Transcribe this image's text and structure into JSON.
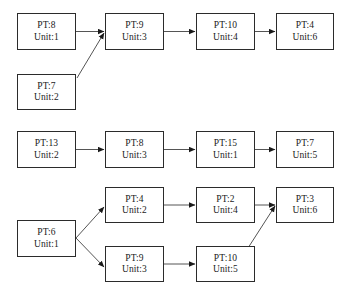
{
  "diagram": {
    "type": "process-flow",
    "background_color": "#ffffff",
    "node_fill_color": "#ffffff",
    "node_border_color": "#2b2b2b",
    "edge_color": "#555555",
    "text_color": "#1a1a1a",
    "label_prefixes": {
      "pt": "PT:",
      "unit": "Unit:"
    },
    "chains": [
      {
        "id": "chain-1",
        "nodes": [
          {
            "id": "n1",
            "pt": "PT:8",
            "unit": "Unit:1",
            "x": 17,
            "y": 13,
            "w": 59,
            "h": 37
          },
          {
            "id": "n2",
            "pt": "PT:9",
            "unit": "Unit:3",
            "x": 105,
            "y": 13,
            "w": 59,
            "h": 37
          },
          {
            "id": "n3",
            "pt": "PT:10",
            "unit": "Unit:4",
            "x": 196,
            "y": 13,
            "w": 59,
            "h": 37
          },
          {
            "id": "n4",
            "pt": "PT:4",
            "unit": "Unit:6",
            "x": 276,
            "y": 13,
            "w": 58,
            "h": 37
          },
          {
            "id": "n5",
            "pt": "PT:7",
            "unit": "Unit:2",
            "x": 17,
            "y": 74,
            "w": 59,
            "h": 36
          }
        ],
        "edges": [
          {
            "from": "n1",
            "to": "n2",
            "kind": "horizontal"
          },
          {
            "from": "n2",
            "to": "n3",
            "kind": "horizontal"
          },
          {
            "from": "n3",
            "to": "n4",
            "kind": "horizontal"
          },
          {
            "from": "n5",
            "to": "n2",
            "kind": "diagonal"
          }
        ]
      },
      {
        "id": "chain-2",
        "nodes": [
          {
            "id": "m1",
            "pt": "PT:13",
            "unit": "Unit:2",
            "x": 17,
            "y": 131,
            "w": 59,
            "h": 37
          },
          {
            "id": "m2",
            "pt": "PT:8",
            "unit": "Unit:3",
            "x": 105,
            "y": 131,
            "w": 59,
            "h": 37
          },
          {
            "id": "m3",
            "pt": "PT:15",
            "unit": "Unit:1",
            "x": 196,
            "y": 131,
            "w": 59,
            "h": 37
          },
          {
            "id": "m4",
            "pt": "PT:7",
            "unit": "Unit:5",
            "x": 276,
            "y": 131,
            "w": 58,
            "h": 37
          }
        ],
        "edges": [
          {
            "from": "m1",
            "to": "m2",
            "kind": "horizontal"
          },
          {
            "from": "m2",
            "to": "m3",
            "kind": "horizontal"
          },
          {
            "from": "m3",
            "to": "m4",
            "kind": "horizontal"
          }
        ]
      },
      {
        "id": "chain-3",
        "nodes": [
          {
            "id": "b1",
            "pt": "PT:6",
            "unit": "Unit:1",
            "x": 17,
            "y": 220,
            "w": 59,
            "h": 37
          },
          {
            "id": "b2",
            "pt": "PT:4",
            "unit": "Unit:2",
            "x": 105,
            "y": 187,
            "w": 59,
            "h": 36
          },
          {
            "id": "b3",
            "pt": "PT:2",
            "unit": "Unit:4",
            "x": 196,
            "y": 187,
            "w": 59,
            "h": 36
          },
          {
            "id": "b4",
            "pt": "PT:3",
            "unit": "Unit:6",
            "x": 276,
            "y": 187,
            "w": 58,
            "h": 36
          },
          {
            "id": "b5",
            "pt": "PT:9",
            "unit": "Unit:3",
            "x": 105,
            "y": 246,
            "w": 59,
            "h": 36
          },
          {
            "id": "b6",
            "pt": "PT:10",
            "unit": "Unit:5",
            "x": 196,
            "y": 246,
            "w": 59,
            "h": 36
          }
        ],
        "edges": [
          {
            "from": "b1",
            "to": "b2",
            "kind": "diagonal"
          },
          {
            "from": "b1",
            "to": "b5",
            "kind": "diagonal"
          },
          {
            "from": "b2",
            "to": "b3",
            "kind": "horizontal"
          },
          {
            "from": "b3",
            "to": "b4",
            "kind": "horizontal"
          },
          {
            "from": "b5",
            "to": "b6",
            "kind": "horizontal"
          },
          {
            "from": "b6",
            "to": "b4",
            "kind": "diagonal"
          }
        ]
      }
    ],
    "arrow_paths": [
      {
        "name": "edge-n1-n2",
        "x1": 76,
        "y1": 31.5,
        "x2": 104,
        "y2": 31.5
      },
      {
        "name": "edge-n2-n3",
        "x1": 164,
        "y1": 31.5,
        "x2": 195,
        "y2": 31.5
      },
      {
        "name": "edge-n3-n4",
        "x1": 255,
        "y1": 31.5,
        "x2": 275,
        "y2": 31.5
      },
      {
        "name": "edge-n5-n2",
        "x1": 77,
        "y1": 78,
        "x2": 104,
        "y2": 33
      },
      {
        "name": "edge-m1-m2",
        "x1": 76,
        "y1": 149.5,
        "x2": 104,
        "y2": 149.5
      },
      {
        "name": "edge-m2-m3",
        "x1": 164,
        "y1": 149.5,
        "x2": 195,
        "y2": 149.5
      },
      {
        "name": "edge-m3-m4",
        "x1": 255,
        "y1": 149.5,
        "x2": 275,
        "y2": 149.5
      },
      {
        "name": "edge-b1-b2",
        "x1": 76,
        "y1": 238,
        "x2": 104,
        "y2": 207
      },
      {
        "name": "edge-b1-b5",
        "x1": 76,
        "y1": 238,
        "x2": 104,
        "y2": 267
      },
      {
        "name": "edge-b2-b3",
        "x1": 164,
        "y1": 205,
        "x2": 195,
        "y2": 205
      },
      {
        "name": "edge-b3-b4",
        "x1": 255,
        "y1": 205,
        "x2": 275,
        "y2": 205
      },
      {
        "name": "edge-b5-b6",
        "x1": 164,
        "y1": 264,
        "x2": 195,
        "y2": 264
      },
      {
        "name": "edge-b6-b4",
        "x1": 248,
        "y1": 248,
        "x2": 275,
        "y2": 206
      }
    ]
  }
}
